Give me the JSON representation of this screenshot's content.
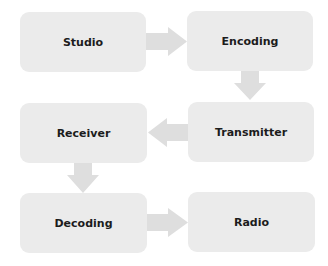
{
  "diagram": {
    "type": "flowchart",
    "colors": {
      "node_fill": "#ebebeb",
      "arrow_fill": "#dedede",
      "text": "#1c1c1c"
    },
    "nodes": [
      {
        "id": "studio",
        "label": "Studio"
      },
      {
        "id": "encoding",
        "label": "Encoding"
      },
      {
        "id": "transmitter",
        "label": "Transmitter"
      },
      {
        "id": "receiver",
        "label": "Receiver"
      },
      {
        "id": "decoding",
        "label": "Decoding"
      },
      {
        "id": "radio",
        "label": "Radio"
      }
    ],
    "edges": [
      {
        "from": "Studio",
        "to": "Encoding",
        "direction": "right"
      },
      {
        "from": "Encoding",
        "to": "Transmitter",
        "direction": "down"
      },
      {
        "from": "Transmitter",
        "to": "Receiver",
        "direction": "left"
      },
      {
        "from": "Receiver",
        "to": "Decoding",
        "direction": "down"
      },
      {
        "from": "Decoding",
        "to": "Radio",
        "direction": "right"
      }
    ]
  }
}
